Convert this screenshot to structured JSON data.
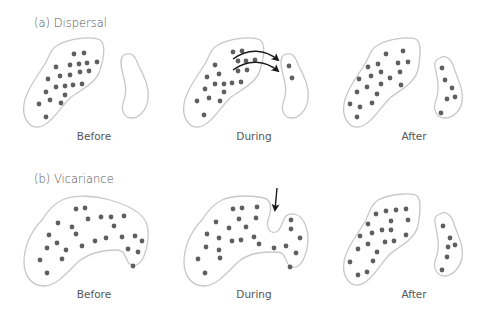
{
  "panels": {
    "a": {
      "title": "(a)  Dispersal",
      "stages": [
        {
          "label": "Before"
        },
        {
          "label": "During"
        },
        {
          "label": "After"
        }
      ]
    },
    "b": {
      "title": "(b)  Vicariance",
      "stages": [
        {
          "label": "Before"
        },
        {
          "label": "During"
        },
        {
          "label": "After"
        }
      ]
    }
  },
  "colors": {
    "region_outline": "#c8c8c8",
    "dot": "#5f5f5f",
    "arrow": "#1a1a1a",
    "text": "#555555"
  }
}
